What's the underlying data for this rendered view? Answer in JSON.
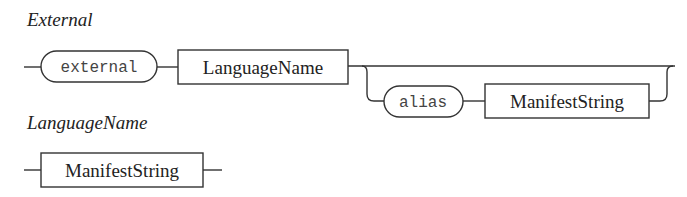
{
  "diagrams": [
    {
      "title": "External",
      "elements": [
        {
          "kind": "terminal",
          "label": "external"
        },
        {
          "kind": "nonterminal",
          "label": "LanguageName"
        },
        {
          "kind": "optional",
          "items": [
            {
              "kind": "terminal",
              "label": "alias"
            },
            {
              "kind": "nonterminal",
              "label": "ManifestString"
            }
          ]
        }
      ]
    },
    {
      "title": "LanguageName",
      "elements": [
        {
          "kind": "nonterminal",
          "label": "ManifestString"
        }
      ]
    }
  ]
}
